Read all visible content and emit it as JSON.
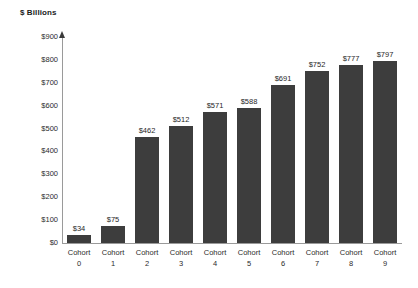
{
  "chart_data": {
    "type": "bar",
    "title": "$ Billions",
    "xlabel": "",
    "ylabel": "$ Billions",
    "ylim": [
      0,
      900
    ],
    "ytick_step": 100,
    "grid": false,
    "legend": false,
    "orientation": "vertical",
    "bar_color": "#3d3d3d",
    "axis_color": "#9a9a9a",
    "value_prefix": "$",
    "categories": [
      "Cohort 0",
      "Cohort 1",
      "Cohort 2",
      "Cohort 3",
      "Cohort 4",
      "Cohort 5",
      "Cohort 6",
      "Cohort 7",
      "Cohort 8",
      "Cohort 9"
    ],
    "category_name": "Cohort",
    "category_numbers": [
      "0",
      "1",
      "2",
      "3",
      "4",
      "5",
      "6",
      "7",
      "8",
      "9"
    ],
    "values": [
      34,
      75,
      462,
      512,
      571,
      588,
      691,
      752,
      777,
      797
    ],
    "data_labels": [
      "$34",
      "$75",
      "$462",
      "$512",
      "$571",
      "$588",
      "$691",
      "$752",
      "$777",
      "$797"
    ],
    "ytick_labels": [
      "$0",
      "$100",
      "$200",
      "$300",
      "$400",
      "$500",
      "$600",
      "$700",
      "$800",
      "$900"
    ],
    "ytick_values": [
      0,
      100,
      200,
      300,
      400,
      500,
      600,
      700,
      800,
      900
    ]
  }
}
